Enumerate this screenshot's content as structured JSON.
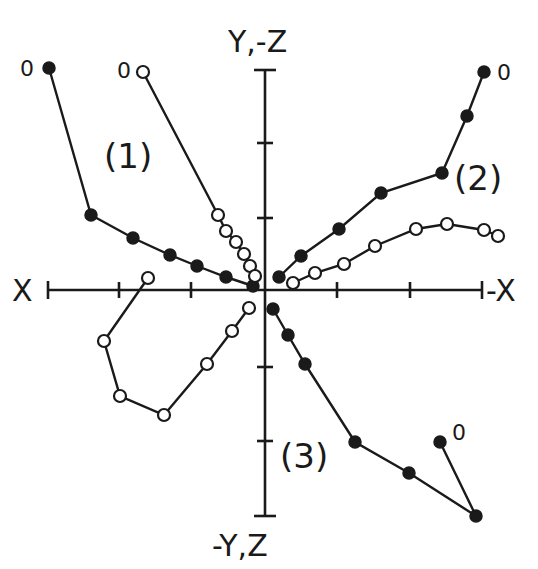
{
  "diagram": {
    "type": "orthogonal vector plot (Zijderveld diagram)",
    "axes": {
      "left_label": "X",
      "right_label": "-X",
      "top_label": "Y,-Z",
      "bottom_label": "-Y,Z",
      "origin_px": [
        265,
        290
      ],
      "x_axis_px": [
        48,
        482
      ],
      "y_axis_px": [
        70,
        516
      ],
      "x_ticks_px": [
        119,
        191,
        337,
        410
      ],
      "y_ticks_px": [
        143,
        218,
        367,
        441
      ]
    },
    "colors": {
      "ink": "#1a1a1a",
      "background": "#ffffff",
      "open_fill": "#ffffff"
    },
    "series_labels": [
      {
        "text": "(1)",
        "x": 104,
        "y": 168
      },
      {
        "text": "(2)",
        "x": 454,
        "y": 190
      },
      {
        "text": "(3)",
        "x": 280,
        "y": 468
      }
    ],
    "origin_labels": [
      {
        "text": "0",
        "x": 20,
        "y": 76
      },
      {
        "text": "0",
        "x": 117,
        "y": 78
      },
      {
        "text": "0",
        "x": 497,
        "y": 80
      },
      {
        "text": "0",
        "x": 452,
        "y": 440
      }
    ],
    "series": [
      {
        "name": "(1) filled - horizontal projection",
        "marker": "filled",
        "points": [
          [
            49,
            68
          ],
          [
            91,
            215
          ],
          [
            133,
            238
          ],
          [
            170,
            255
          ],
          [
            197,
            266
          ],
          [
            226,
            277
          ],
          [
            253,
            286
          ]
        ]
      },
      {
        "name": "(1) open - vertical projection",
        "marker": "open",
        "points": [
          [
            143,
            72
          ],
          [
            218,
            215
          ],
          [
            226,
            231
          ],
          [
            236,
            242
          ],
          [
            244,
            254
          ],
          [
            250,
            266
          ],
          [
            255,
            276
          ]
        ]
      },
      {
        "name": "(2) filled - horizontal projection",
        "marker": "filled",
        "points": [
          [
            484,
            72
          ],
          [
            467,
            116
          ],
          [
            442,
            173
          ],
          [
            381,
            193
          ],
          [
            339,
            229
          ],
          [
            301,
            256
          ],
          [
            279,
            277
          ]
        ]
      },
      {
        "name": "(2) open - vertical projection",
        "marker": "open",
        "points": [
          [
            498,
            236
          ],
          [
            484,
            230
          ],
          [
            447,
            224
          ],
          [
            416,
            229
          ],
          [
            375,
            246
          ],
          [
            344,
            264
          ],
          [
            315,
            273
          ],
          [
            293,
            283
          ]
        ]
      },
      {
        "name": "(3) filled - horizontal projection",
        "marker": "filled",
        "points": [
          [
            440,
            442
          ],
          [
            476,
            516
          ],
          [
            409,
            473
          ],
          [
            355,
            442
          ],
          [
            305,
            364
          ],
          [
            288,
            335
          ],
          [
            273,
            309
          ]
        ]
      },
      {
        "name": "(3) open - vertical projection",
        "marker": "open",
        "points": [
          [
            148,
            278
          ],
          [
            104,
            341
          ],
          [
            120,
            396
          ],
          [
            164,
            415
          ],
          [
            207,
            364
          ],
          [
            232,
            331
          ],
          [
            249,
            308
          ]
        ]
      }
    ]
  }
}
